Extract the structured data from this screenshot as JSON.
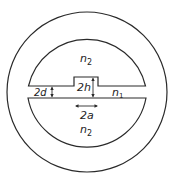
{
  "diagram": {
    "type": "cross-section",
    "regions": [
      {
        "id": "upper-cladding",
        "label": "n",
        "subscript": "2"
      },
      {
        "id": "lower-cladding",
        "label": "n",
        "subscript": "2"
      },
      {
        "id": "guiding-layer",
        "label": "n",
        "subscript": "1"
      }
    ],
    "dimensions": [
      {
        "id": "film-thickness",
        "label": "2d",
        "orientation": "vertical"
      },
      {
        "id": "rib-height",
        "label": "2h",
        "orientation": "vertical"
      },
      {
        "id": "rib-width",
        "label": "2a",
        "orientation": "horizontal"
      }
    ]
  }
}
